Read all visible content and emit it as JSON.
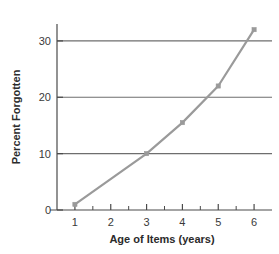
{
  "chart_data": {
    "type": "line",
    "title": "",
    "subtitle": "",
    "xlabel": "Age of Items (years)",
    "ylabel": "Percent Forgotten",
    "x": [
      1,
      3,
      4,
      5,
      6
    ],
    "values": [
      1,
      10,
      15.5,
      22,
      32
    ],
    "series": [
      {
        "name": "Percent Forgotten",
        "x": [
          1,
          3,
          4,
          5,
          6
        ],
        "values": [
          1,
          10,
          15.5,
          22,
          32
        ]
      }
    ],
    "xlim": [
      0.5,
      6.5
    ],
    "ylim": [
      0,
      33
    ],
    "x_ticks": [
      1,
      2,
      3,
      4,
      5,
      6
    ],
    "x_tick_labels": [
      "1",
      "2",
      "3",
      "4",
      "5",
      "6"
    ],
    "x_minor_ticks": [
      1.5,
      2.5,
      3.5,
      4.5,
      5.5
    ],
    "y_ticks": [
      0,
      10,
      20,
      30
    ],
    "y_tick_labels": [
      "0",
      "10",
      "20",
      "30"
    ],
    "gridlines": [
      10,
      20,
      30
    ],
    "grid": true,
    "legend": "none",
    "marker": "square",
    "line_color": "#9a9a9a",
    "marker_color": "#9a9a9a",
    "grid_color": "#6e6e6e",
    "axis_color": "#4a4a4a",
    "background": "#ffffff"
  },
  "axes": {
    "x_title": "Age of Items (years)",
    "y_title": "Percent Forgotten"
  },
  "ticks": {
    "y": [
      {
        "label": "30",
        "value": 30
      },
      {
        "label": "20",
        "value": 20
      },
      {
        "label": "10",
        "value": 10
      },
      {
        "label": "0",
        "value": 0
      }
    ],
    "x": [
      {
        "label": "1",
        "value": 1
      },
      {
        "label": "2",
        "value": 2
      },
      {
        "label": "3",
        "value": 3
      },
      {
        "label": "4",
        "value": 4
      },
      {
        "label": "5",
        "value": 5
      },
      {
        "label": "6",
        "value": 6
      }
    ]
  }
}
